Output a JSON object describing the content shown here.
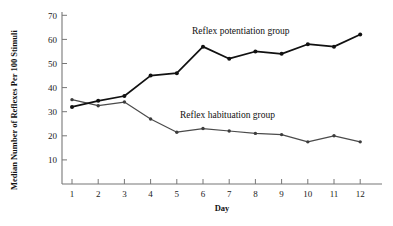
{
  "figure": {
    "background_color": "#ffffff",
    "axis_color": "#777777"
  },
  "chart_data": {
    "type": "line",
    "title": "",
    "xlabel": "Day",
    "ylabel": "Median Number of Reflexes Per 100 Stimuli",
    "x": [
      1,
      2,
      3,
      4,
      5,
      6,
      7,
      8,
      9,
      10,
      11,
      12
    ],
    "xtick_labels": [
      "1",
      "2",
      "3",
      "4",
      "5",
      "6",
      "7",
      "8",
      "9",
      "10",
      "11",
      "12"
    ],
    "ytick_labels": [
      "10",
      "20",
      "30",
      "40",
      "50",
      "60",
      "70"
    ],
    "yticks": [
      10,
      20,
      30,
      40,
      50,
      60,
      70
    ],
    "xlim": [
      0.4,
      12.6
    ],
    "ylim": [
      0,
      73
    ],
    "grid": false,
    "legend_position": "inline-annotation",
    "series": [
      {
        "name": "Reflex potentiation group",
        "color": "#111111",
        "marker": "filled-circle",
        "values": [
          32,
          34.5,
          36.5,
          45,
          46,
          57,
          52,
          55,
          54,
          58,
          57,
          62
        ],
        "label_text": "Reflex potentiation group"
      },
      {
        "name": "Reflex habituation group",
        "color": "#3c3c3c",
        "marker": "filled-circle",
        "values": [
          35,
          32.5,
          34,
          27,
          21.5,
          23,
          22,
          21,
          20.5,
          17.5,
          20,
          17.5
        ],
        "label_text": "Reflex habituation group"
      }
    ],
    "annotations": [
      {
        "text": "Reflex potentiation group",
        "x_px": 192,
        "y_px": 34
      },
      {
        "text": "Reflex habituation group",
        "x_px": 180,
        "y_px": 118
      }
    ]
  }
}
